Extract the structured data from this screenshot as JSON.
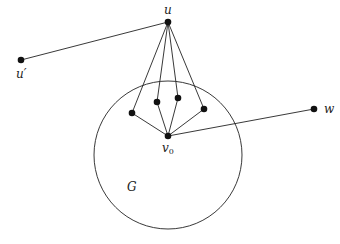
{
  "diagram": {
    "circle": {
      "label": "G",
      "cx": 168,
      "cy": 155,
      "r": 74
    },
    "nodes": [
      {
        "id": "u",
        "label": "u",
        "x": 168,
        "y": 22
      },
      {
        "id": "u_prime",
        "label": "u′",
        "x": 21,
        "y": 60
      },
      {
        "id": "w",
        "label": "w",
        "x": 314,
        "y": 109
      },
      {
        "id": "v0",
        "label": "v",
        "sub": "0",
        "x": 168,
        "y": 136
      },
      {
        "id": "a1",
        "label": "",
        "x": 132,
        "y": 113
      },
      {
        "id": "a2",
        "label": "",
        "x": 157,
        "y": 102
      },
      {
        "id": "a3",
        "label": "",
        "x": 178,
        "y": 98
      },
      {
        "id": "a4",
        "label": "",
        "x": 204,
        "y": 109
      }
    ],
    "edges": [
      [
        "u",
        "u_prime"
      ],
      [
        "u",
        "a1"
      ],
      [
        "u",
        "a2"
      ],
      [
        "u",
        "a3"
      ],
      [
        "u",
        "a4"
      ],
      [
        "v0",
        "a1"
      ],
      [
        "v0",
        "a2"
      ],
      [
        "v0",
        "a3"
      ],
      [
        "v0",
        "a4"
      ],
      [
        "v0",
        "w"
      ]
    ],
    "colors": {
      "stroke": "#222222",
      "node": "#111111"
    }
  }
}
